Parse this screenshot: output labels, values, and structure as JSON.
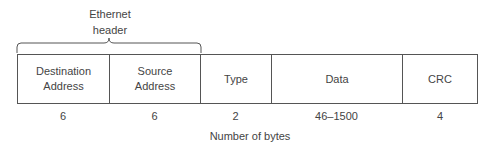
{
  "header_group": {
    "label_line1": "Ethernet",
    "label_line2": "header"
  },
  "fields": [
    {
      "name": "Destination Address",
      "line1": "Destination",
      "line2": "Address",
      "bytes": "6"
    },
    {
      "name": "Source Address",
      "line1": "Source",
      "line2": "Address",
      "bytes": "6"
    },
    {
      "name": "Type",
      "line1": "Type",
      "line2": "",
      "bytes": "2"
    },
    {
      "name": "Data",
      "line1": "Data",
      "line2": "",
      "bytes": "46–1500"
    },
    {
      "name": "CRC",
      "line1": "CRC",
      "line2": "",
      "bytes": "4"
    }
  ],
  "caption": "Number of bytes",
  "colors": {
    "stroke": "#555555",
    "text": "#444444",
    "background": "#ffffff"
  }
}
